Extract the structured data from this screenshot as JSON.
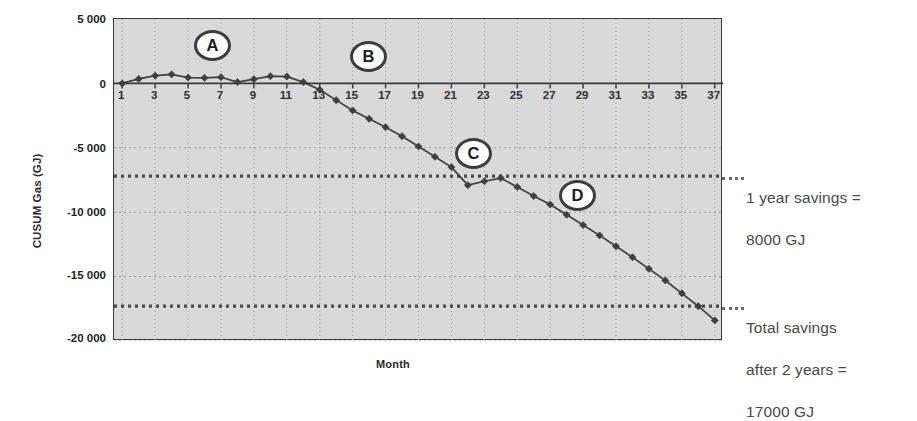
{
  "chart_data": {
    "type": "line",
    "title": "",
    "xlabel": "Month",
    "ylabel": "CUSUM Gas (GJ)",
    "xlim": [
      0.5,
      37.5
    ],
    "ylim": [
      -20000,
      5000
    ],
    "grid": true,
    "legend": "none",
    "y_ticks": [
      "5 000",
      "0",
      "-5 000",
      "-10 000",
      "-15 000",
      "-20 000"
    ],
    "y_tick_values": [
      5000,
      0,
      -5000,
      -10000,
      -15000,
      -20000
    ],
    "x_ticks": [
      "1",
      "3",
      "5",
      "7",
      "9",
      "11",
      "13",
      "15",
      "17",
      "19",
      "21",
      "23",
      "25",
      "27",
      "29",
      "31",
      "33",
      "35",
      "37"
    ],
    "x_tick_values": [
      1,
      3,
      5,
      7,
      9,
      11,
      13,
      15,
      17,
      19,
      21,
      23,
      25,
      27,
      29,
      31,
      33,
      35,
      37
    ],
    "series": [
      {
        "name": "CUSUM Gas",
        "marker": "diamond",
        "color": "#3f3f3f",
        "x": [
          1,
          2,
          3,
          4,
          5,
          6,
          7,
          8,
          9,
          10,
          11,
          12,
          13,
          14,
          15,
          16,
          17,
          18,
          19,
          20,
          21,
          22,
          23,
          24,
          25,
          26,
          27,
          28,
          29,
          30,
          31,
          32,
          33,
          34,
          35,
          36,
          37
        ],
        "values": [
          0,
          350,
          600,
          700,
          450,
          430,
          480,
          100,
          330,
          560,
          530,
          100,
          -500,
          -1300,
          -2100,
          -2750,
          -3400,
          -4100,
          -4900,
          -5700,
          -6500,
          -7900,
          -7600,
          -7350,
          -8050,
          -8750,
          -9400,
          -10200,
          -11000,
          -11800,
          -12650,
          -13500,
          -14400,
          -15300,
          -16300,
          -17300,
          -18400
        ]
      }
    ],
    "reference_lines": [
      {
        "name": "one-year-savings",
        "value": -7200,
        "style": "dotted",
        "label": "1 year savings =\n8000 GJ"
      },
      {
        "name": "total-savings",
        "value": -17300,
        "style": "dotted",
        "label": "Total savings\nafter 2 years =\n17000 GJ"
      }
    ],
    "callouts": [
      {
        "label": "A",
        "x_px": 194,
        "y_px": 30
      },
      {
        "label": "B",
        "x_px": 350,
        "y_px": 41
      },
      {
        "label": "C",
        "x_px": 455,
        "y_px": 138
      },
      {
        "label": "D",
        "x_px": 559,
        "y_px": 180
      }
    ]
  },
  "axes": {
    "y_title": "CUSUM Gas (GJ)",
    "x_title": "Month"
  },
  "annotations": {
    "one_year": {
      "line1": "1 year savings =",
      "line2": "8000 GJ"
    },
    "total": {
      "line1": "Total savings",
      "line2": "after 2 years =",
      "line3": "17000 GJ"
    }
  }
}
